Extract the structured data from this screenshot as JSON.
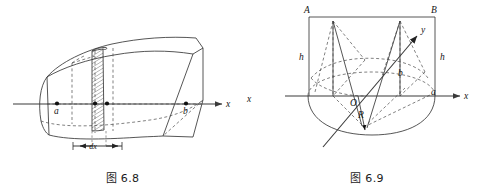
{
  "page": {
    "background": "#ffffff",
    "ink": "#1a1a1a",
    "width": 489,
    "height": 191
  },
  "figures": [
    {
      "id": "fig-6-8",
      "caption": "图 6.8",
      "kind": "3d-solid-with-cross-section-slab",
      "axis_label": "x",
      "labels": {
        "left_point": "a",
        "right_point": "b",
        "slab_thickness": "dx"
      },
      "points": [
        {
          "name": "a",
          "label": "a"
        },
        {
          "name": "x",
          "label": ""
        },
        {
          "name": "x-plus-dx",
          "label": ""
        },
        {
          "name": "b",
          "label": "b"
        }
      ],
      "notes": "A curved prism/solid cut by two planes perpendicular to the x-axis; the thin hatched slab between them has thickness dx."
    },
    {
      "id": "fig-6-9",
      "caption": "图 6.9",
      "kind": "cylinder-wedge-with-coordinate-axes",
      "labels": {
        "top_left_corner": "A",
        "top_right_corner": "B",
        "height_left": "h",
        "height_right": "h",
        "origin": "O",
        "radius": "R",
        "x_axis": "x",
        "y_axis": "y",
        "x_axis_secondary": "x",
        "point_b": "b",
        "point_a": "a"
      },
      "notes": "Rectangle A-B atop a half-disc / cylinder base, with an oblique y-axis arrow through the origin, radius R marked from O, and points a, b on the circle."
    }
  ],
  "captions": {
    "left": "图 6.8",
    "right": "图 6.9"
  }
}
